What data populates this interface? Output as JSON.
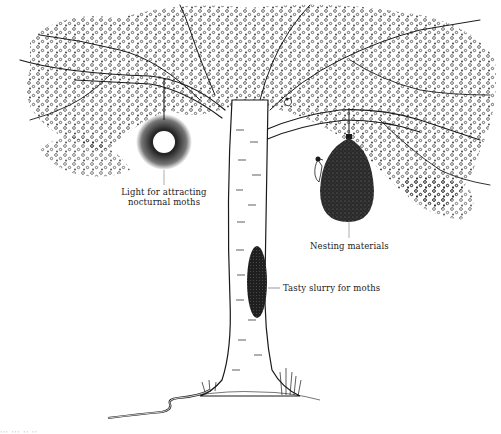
{
  "figure": {
    "kind": "pen-and-ink illustration",
    "colors": {
      "ink": "#1a1a1a",
      "paper": "#ffffff"
    }
  },
  "labels": {
    "light": {
      "line1": "Light for attracting",
      "line2": "nocturnal moths"
    },
    "nesting": {
      "text": "Nesting materials"
    },
    "slurry": {
      "text": "Tasty slurry for moths"
    }
  },
  "elements": {
    "light_lamp": "hanging-light",
    "nesting_bag": "hanging-nesting-bag",
    "slurry_patch": "slurry-on-trunk",
    "woodpecker": "bird",
    "small_bird": "bird",
    "hose": "garden-hose"
  },
  "caption_fragment": {
    "text": "··· ··· ·· ··"
  }
}
